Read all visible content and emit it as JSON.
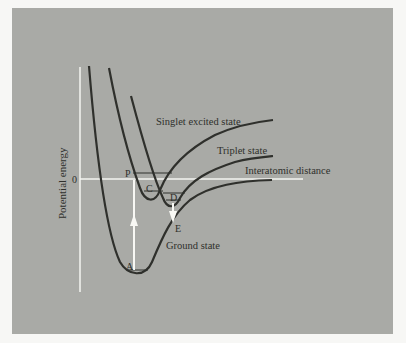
{
  "diagram": {
    "axes": {
      "y_label": "Potential energy",
      "zero_label": "0",
      "x_label": "Interatomic distance"
    },
    "curves": [
      {
        "name": "Singlet excited state"
      },
      {
        "name": "Triplet state"
      },
      {
        "name": "Ground state"
      }
    ],
    "points": {
      "P": "P",
      "C": "C",
      "D": "D",
      "E": "E",
      "A": "A"
    },
    "colors": {
      "panel": "#a9aaa6",
      "curve": "#2f302c",
      "axis": "#f4f4f0",
      "arrow": "#f8f8f4"
    }
  }
}
